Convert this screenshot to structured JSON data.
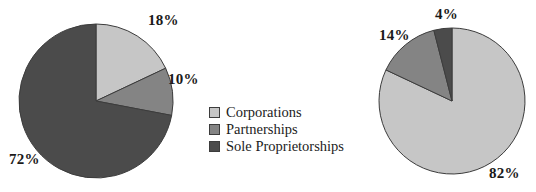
{
  "chart_data": [
    {
      "type": "pie",
      "name": "left-pie",
      "title": "",
      "categories": [
        "Corporations",
        "Partnerships",
        "Sole Proprietorships"
      ],
      "values": [
        18,
        10,
        72
      ],
      "labels": [
        "18%",
        "10%",
        "72%"
      ],
      "units": "percent",
      "start_angle_deg": 0,
      "direction": "clockwise",
      "center": {
        "x": 96,
        "y": 101
      },
      "radius": 77,
      "colors": [
        "#c6c6c6",
        "#848484",
        "#4b4b4b"
      ]
    },
    {
      "type": "pie",
      "name": "right-pie",
      "title": "",
      "categories": [
        "Corporations",
        "Partnerships",
        "Sole Proprietorships"
      ],
      "values": [
        82,
        14,
        4
      ],
      "labels": [
        "82%",
        "14%",
        "4%"
      ],
      "units": "percent",
      "start_angle_deg": 0,
      "direction": "clockwise",
      "center": {
        "x": 452,
        "y": 101
      },
      "radius": 73,
      "colors": [
        "#c6c6c6",
        "#848484",
        "#4b4b4b"
      ]
    }
  ],
  "left_pie": {
    "label_corporations": "18%",
    "label_partnerships": "10%",
    "label_sole": "72%"
  },
  "right_pie": {
    "label_corporations": "82%",
    "label_partnerships": "14%",
    "label_sole": "4%"
  },
  "legend": {
    "items": [
      {
        "label": "Corporations",
        "color": "#c6c6c6"
      },
      {
        "label": "Partnerships",
        "color": "#848484"
      },
      {
        "label": "Sole Proprietorships",
        "color": "#4b4b4b"
      }
    ]
  },
  "colors": {
    "corporations": "#c6c6c6",
    "partnerships": "#848484",
    "sole_proprietorships": "#4b4b4b",
    "outline": "#3c3c3c",
    "background": "#ffffff",
    "text": "#1a1a1a"
  }
}
